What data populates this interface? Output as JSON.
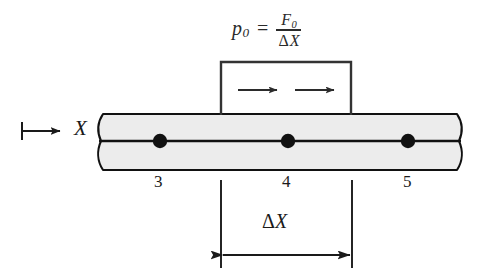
{
  "figure": {
    "background_color": "#ffffff",
    "ink_color": "#1a1a1a",
    "beam_fill_color": "#ececec"
  },
  "formula": {
    "name": "pressure-definition",
    "lhs_symbol": "p",
    "lhs_subscript": "0",
    "equals": "=",
    "numerator_symbol": "F",
    "numerator_subscript": "0",
    "denominator_delta": "Δ",
    "denominator_symbol": "X",
    "plain_text": "p0 = F0 / ΔX"
  },
  "load_box": {
    "name": "distributed-load-box",
    "arrow_count": 2,
    "arrow_direction": "right",
    "x": 221,
    "y": 62,
    "width": 130,
    "height": 54
  },
  "axis_marker": {
    "label": "X",
    "direction": "right",
    "tick_x": 22,
    "arrow_from_x": 22,
    "arrow_to_x": 60,
    "y": 131
  },
  "beam": {
    "name": "bar-element",
    "left_x": 100,
    "right_x": 460,
    "top_y": 114,
    "bottom_y": 170,
    "centerline_y": 141,
    "break_style": "wavy"
  },
  "nodes": [
    {
      "label": "3",
      "x": 160,
      "y": 141
    },
    {
      "label": "4",
      "x": 288,
      "y": 141
    },
    {
      "label": "5",
      "x": 408,
      "y": 141
    }
  ],
  "dimension": {
    "name": "element-length",
    "delta": "Δ",
    "symbol": "X",
    "label": "ΔX",
    "left_x": 221,
    "right_x": 352,
    "arrow_y": 255,
    "extension_top_y": 180,
    "extension_bottom_y": 268
  }
}
